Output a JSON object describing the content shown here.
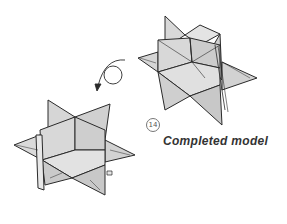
{
  "diagram": {
    "step_number": "14",
    "caption": "Completed model",
    "figures": [
      {
        "id": "model-front-view",
        "description": "Completed origami star (stellated octahedron style) viewed from front-right"
      },
      {
        "id": "model-rotated-view",
        "description": "Same completed origami star shown after rotation"
      }
    ],
    "rotation_arrow": {
      "description": "Circular arrow indicating to turn the model over"
    },
    "colors": {
      "paper_fill": "#d4d4d4",
      "paper_fill_light": "#e2e2e2",
      "line": "#2a2a2a",
      "background": "#ffffff",
      "text": "#333333"
    }
  }
}
